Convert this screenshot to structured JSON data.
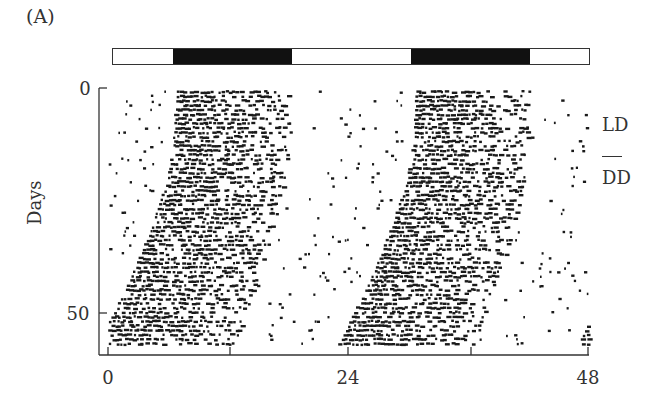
{
  "figure": {
    "panel_label": "(A)",
    "ylabel": "Days",
    "xticks": [
      "0",
      "24",
      "48"
    ],
    "yticks": [
      "0",
      "50"
    ],
    "condition_labels": {
      "top": "LD",
      "bottom": "DD"
    },
    "light_dark_bar": [
      {
        "state": "light",
        "hours": 6
      },
      {
        "state": "dark",
        "hours": 12
      },
      {
        "state": "light",
        "hours": 12
      },
      {
        "state": "dark",
        "hours": 12
      },
      {
        "state": "light",
        "hours": 6
      }
    ],
    "colors": {
      "ink": "#1a1a1a",
      "axis": "#333333",
      "background": "#ffffff"
    }
  },
  "chart_data": {
    "type": "scatter",
    "subtype": "double-plotted actogram",
    "title": "",
    "panel": "(A)",
    "xlabel": "",
    "ylabel": "Days",
    "xlim": [
      0,
      48
    ],
    "ylim": [
      57,
      0
    ],
    "xticks": [
      0,
      12,
      24,
      36,
      48
    ],
    "xtick_labels": [
      "0",
      "",
      "24",
      "",
      "48"
    ],
    "yticks": [
      0,
      50
    ],
    "ytick_labels": [
      "0",
      "50"
    ],
    "legend": [
      "LD",
      "DD"
    ],
    "annotations": [
      "LD",
      "DD"
    ],
    "light_dark_schedule": {
      "lights_off_hour": 6,
      "lights_on_hour": 18,
      "period_h": 24
    },
    "phases": [
      {
        "condition": "LD",
        "days": [
          0,
          14
        ],
        "activity_onset_h": 6.5,
        "activity_offset_h": 18
      },
      {
        "condition": "DD",
        "days": [
          14,
          57
        ],
        "activity_onset_h_start": 6.5,
        "activity_onset_h_end": -1.0,
        "activity_offset_h_start": 18,
        "activity_offset_h_end": 12.5,
        "free_running_period_h": 23.85
      }
    ],
    "onset_trace": [
      {
        "day": 0,
        "onset_h": 6.7,
        "offset_h": 18.0
      },
      {
        "day": 10,
        "onset_h": 6.5,
        "offset_h": 18.0
      },
      {
        "day": 20,
        "onset_h": 5.8,
        "offset_h": 17.5
      },
      {
        "day": 30,
        "onset_h": 4.3,
        "offset_h": 16.5
      },
      {
        "day": 40,
        "onset_h": 2.5,
        "offset_h": 15.0
      },
      {
        "day": 50,
        "onset_h": 0.3,
        "offset_h": 13.5
      },
      {
        "day": 56,
        "onset_h": -1.0,
        "offset_h": 12.5
      }
    ],
    "grid": false
  }
}
